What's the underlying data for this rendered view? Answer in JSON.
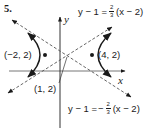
{
  "problem_number": "5.",
  "axes": {
    "x_label": "x",
    "y_label": "y"
  },
  "asymptotes": [
    {
      "name": "positive-slope",
      "lhs": "y − 1 =",
      "sign": "",
      "frac_num": "2",
      "frac_den": "3",
      "rhs": "(x − 2)"
    },
    {
      "name": "negative-slope",
      "lhs": "y − 1 =",
      "sign": "−",
      "frac_num": "2",
      "frac_den": "3",
      "rhs": "(x − 2)"
    }
  ],
  "points": {
    "left_vertex": "(−2, 2)",
    "right_vertex": "(4, 2)",
    "center": "(1, 2)"
  },
  "colors": {
    "ink": "#1a1a1a",
    "dashed": "#555555",
    "background": "#ffffff"
  }
}
